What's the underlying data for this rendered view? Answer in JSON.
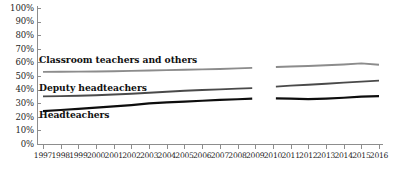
{
  "chart_data": {
    "type": "line",
    "title": "",
    "subtitle": "",
    "xlabel": "",
    "ylabel": "",
    "ylim": [
      0,
      100
    ],
    "ytick_format": "percent",
    "grid": false,
    "legend_position": "inline-labels",
    "yticks": [
      "0%",
      "10%",
      "20%",
      "30%",
      "40%",
      "50%",
      "60%",
      "70%",
      "80%",
      "90%",
      "100%"
    ],
    "ytick_values": [
      0,
      10,
      20,
      30,
      40,
      50,
      60,
      70,
      80,
      90,
      100
    ],
    "categories": [
      "1997",
      "1998",
      "1999",
      "2000",
      "2001",
      "2002",
      "2003",
      "2004",
      "2005",
      "2006",
      "2007",
      "2008",
      "2009",
      "2010",
      "2011",
      "2012",
      "2013",
      "2014",
      "2015",
      "2016"
    ],
    "x": [
      1997,
      1998,
      1999,
      2000,
      2001,
      2002,
      2003,
      2004,
      2005,
      2006,
      2007,
      2008,
      2009,
      2010,
      2011,
      2012,
      2013,
      2014,
      2015,
      2016
    ],
    "series_break_between": [
      "2009",
      "2010"
    ],
    "series": [
      {
        "name": "Classroom teachers and others",
        "color": "#8c8c8c",
        "width": 1.9,
        "values": [
          53.0,
          53.1,
          53.2,
          53.3,
          53.5,
          53.8,
          54.0,
          54.3,
          54.6,
          54.9,
          55.2,
          55.6,
          56.0,
          56.6,
          57.0,
          57.4,
          57.9,
          58.5,
          59.3,
          58.3
        ]
      },
      {
        "name": "Deputy headteachers",
        "color": "#4a4a4a",
        "width": 1.9,
        "values": [
          35.0,
          35.2,
          35.5,
          35.9,
          36.4,
          37.0,
          37.7,
          38.4,
          39.1,
          39.7,
          40.2,
          40.7,
          41.1,
          42.2,
          42.9,
          43.6,
          44.3,
          45.1,
          45.9,
          46.6
        ]
      },
      {
        "name": "Headteachers",
        "color": "#0d0d0d",
        "width": 2.2,
        "values": [
          24.2,
          25.0,
          25.9,
          26.8,
          27.6,
          28.6,
          29.8,
          30.6,
          31.2,
          31.8,
          32.4,
          32.9,
          33.3,
          33.6,
          33.4,
          33.0,
          33.4,
          34.0,
          34.8,
          35.2
        ]
      }
    ],
    "series_labels": [
      {
        "text": "Classroom teachers and others",
        "x_px": 39,
        "y_px": 55
      },
      {
        "text": "Deputy headteachers",
        "x_px": 39,
        "y_px": 83
      },
      {
        "text": "Headteachers",
        "x_px": 39,
        "y_px": 110
      }
    ]
  }
}
